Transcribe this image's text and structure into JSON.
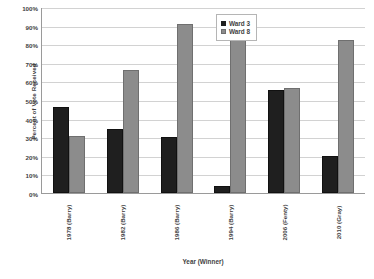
{
  "chart_data": {
    "type": "bar",
    "title": "",
    "xlabel": "Year (Winner)",
    "ylabel": "Percent of Vote Received",
    "categories": [
      "1978 (Barry)",
      "1982 (Barry)",
      "1986 (Barry)",
      "1994 (Barry)",
      "2006 (Fenty)",
      "2010 (Gray)"
    ],
    "series": [
      {
        "name": "Ward 3",
        "color": "#1f1f1f",
        "values": [
          46.5,
          34.5,
          30.0,
          4.0,
          55.5,
          20.0
        ]
      },
      {
        "name": "Ward 8",
        "color": "#8c8c8c",
        "values": [
          30.5,
          66.0,
          91.0,
          82.0,
          56.5,
          82.0
        ]
      }
    ],
    "ylim": [
      0,
      100
    ],
    "ytick_labels": [
      "100%",
      "90%",
      "80%",
      "70%",
      "60%",
      "50%",
      "40%",
      "30%",
      "20%",
      "10%",
      "0%"
    ],
    "ytick_values": [
      100,
      90,
      80,
      70,
      60,
      50,
      40,
      30,
      20,
      10,
      0
    ],
    "grid": true,
    "legend_position": "top-center-right-inside",
    "legend": [
      "Ward 3",
      "Ward 8"
    ]
  }
}
